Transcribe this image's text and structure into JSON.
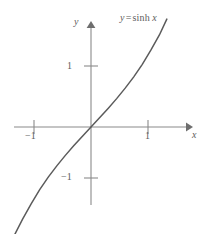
{
  "figure": {
    "title_label": "y = sinh x",
    "equation_parts": {
      "lhs": "y",
      "operator": "=",
      "function": "sinh",
      "argument": "x"
    },
    "background_color": "#ffffff",
    "curve_color": "#5b5b5b",
    "axis_color": "#8a8a8a",
    "text_color": "#5d5d5d"
  },
  "axes": {
    "x_axis_name": "x",
    "y_axis_name": "y",
    "x_ticks": [
      {
        "value": -1,
        "label": "−1"
      },
      {
        "value": 1,
        "label": "1"
      }
    ],
    "y_ticks": [
      {
        "value": 1,
        "label": "1"
      },
      {
        "value": -1,
        "label": "−1"
      }
    ]
  },
  "chart_data": {
    "type": "line",
    "xlabel": "x",
    "ylabel": "y",
    "xlim": [
      -1.35,
      1.72
    ],
    "ylim": [
      -1.72,
      1.72
    ],
    "grid": false,
    "legend": "none",
    "x_ticks": [
      -1,
      1
    ],
    "x_ticklabels": [
      "−1",
      "1"
    ],
    "y_ticks": [
      -1,
      1
    ],
    "y_ticklabels": [
      "−1",
      "1"
    ],
    "series": [
      {
        "name": "y = sinh x",
        "x": [
          -1.35,
          -1.2,
          -1.05,
          -0.9,
          -0.75,
          -0.6,
          -0.45,
          -0.3,
          -0.15,
          0,
          0.15,
          0.3,
          0.45,
          0.6,
          0.75,
          0.9,
          1.05,
          1.2,
          1.33
        ],
        "values": [
          -1.785,
          -1.509,
          -1.26,
          -1.027,
          -0.822,
          -0.637,
          -0.465,
          -0.305,
          -0.151,
          0,
          0.151,
          0.305,
          0.465,
          0.637,
          0.822,
          1.027,
          1.26,
          1.509,
          1.768
        ]
      }
    ]
  }
}
